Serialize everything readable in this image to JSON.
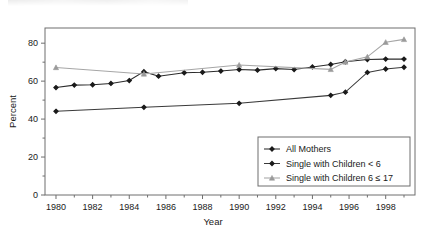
{
  "figure": {
    "background": "#ffffff",
    "frame_color": "#6e6e6e"
  },
  "chart_data": {
    "type": "line",
    "title": "",
    "xlabel": "Year",
    "ylabel": "Percent",
    "xlim": [
      1979.4,
      1999.6
    ],
    "ylim": [
      0,
      88
    ],
    "grid": false,
    "legend_position": "lower right",
    "xticks": [
      1980,
      1982,
      1984,
      1986,
      1988,
      1990,
      1992,
      1994,
      1996,
      1998
    ],
    "xtick_labels": [
      "1980",
      "1982",
      "1984",
      "1986",
      "1988",
      "1990",
      "1992",
      "1994",
      "1996",
      "1998"
    ],
    "xminor_ticks": [
      1981,
      1983,
      1985,
      1987,
      1989,
      1991,
      1993,
      1995,
      1997,
      1999
    ],
    "yticks": [
      0,
      20,
      40,
      60,
      80
    ],
    "ytick_labels": [
      "0",
      "20",
      "40",
      "60",
      "80"
    ],
    "yminor_ticks": [
      10,
      30,
      50,
      70
    ],
    "series": [
      {
        "name": "All Mothers",
        "color": "#2b2b2b",
        "marker": "diamond",
        "marker_color": "#1a1a1a",
        "x": [
          1980,
          1981,
          1982,
          1983,
          1984,
          1984.8,
          1985.6,
          1987,
          1988,
          1989,
          1990,
          1991,
          1992,
          1993,
          1994,
          1995,
          1995.8,
          1997,
          1998,
          1999
        ],
        "y": [
          56.6,
          57.9,
          58.1,
          58.8,
          60.3,
          65.0,
          62.6,
          64.4,
          64.7,
          65.3,
          66.1,
          65.8,
          66.6,
          66.1,
          67.5,
          68.8,
          70.2,
          71.4,
          71.6,
          71.6
        ]
      },
      {
        "name": "Single with Children < 6",
        "color": "#3a3a3a",
        "marker": "diamond",
        "marker_color": "#1a1a1a",
        "x": [
          1980,
          1984.8,
          1990,
          1995,
          1995.8,
          1997,
          1998,
          1999
        ],
        "y": [
          44.1,
          46.2,
          48.3,
          52.5,
          54.2,
          64.6,
          66.4,
          67.3
        ]
      },
      {
        "name": "Single with Children 6 ≤ 17",
        "color": "#a6a6a6",
        "marker": "triangle",
        "marker_color": "#9a9a9a",
        "x": [
          1980,
          1984.8,
          1990,
          1995,
          1995.8,
          1997,
          1998,
          1999
        ],
        "y": [
          67.2,
          63.8,
          68.5,
          66.2,
          70.1,
          72.8,
          80.5,
          82.0
        ]
      }
    ]
  },
  "legend": {
    "entries": [
      {
        "label": "All Mothers"
      },
      {
        "label": "Single with Children < 6"
      },
      {
        "label": "Single with Children 6 ≤ 17"
      }
    ]
  }
}
